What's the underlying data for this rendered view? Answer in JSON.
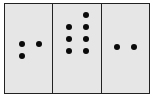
{
  "diagram": {
    "colors": {
      "background": "#e6e6e6",
      "border": "#222222",
      "dot": "#0a0a0a"
    },
    "panels": [
      {
        "id": "panel-1",
        "dot_count": 3,
        "dots": [
          [
            17,
            40
          ],
          [
            34,
            40
          ],
          [
            17,
            52
          ]
        ]
      },
      {
        "id": "panel-2",
        "dot_count": 7,
        "dots": [
          [
            16,
            23
          ],
          [
            33,
            11
          ],
          [
            33,
            23
          ],
          [
            16,
            35
          ],
          [
            33,
            35
          ],
          [
            16,
            47
          ],
          [
            33,
            47
          ]
        ]
      },
      {
        "id": "panel-3",
        "dot_count": 2,
        "dots": [
          [
            15,
            43
          ],
          [
            32,
            43
          ]
        ]
      }
    ]
  }
}
